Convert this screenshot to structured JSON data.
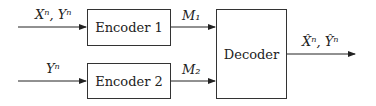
{
  "diagram": {
    "encoder1": {
      "label": "Encoder 1"
    },
    "encoder2": {
      "label": "Encoder 2"
    },
    "decoder": {
      "label": "Decoder"
    },
    "inputs": {
      "in1": "Xⁿ, Yⁿ",
      "in2": "Yⁿ"
    },
    "messages": {
      "m1": "M₁",
      "m2": "M₂"
    },
    "output": "X̂ⁿ, Ŷⁿ"
  }
}
